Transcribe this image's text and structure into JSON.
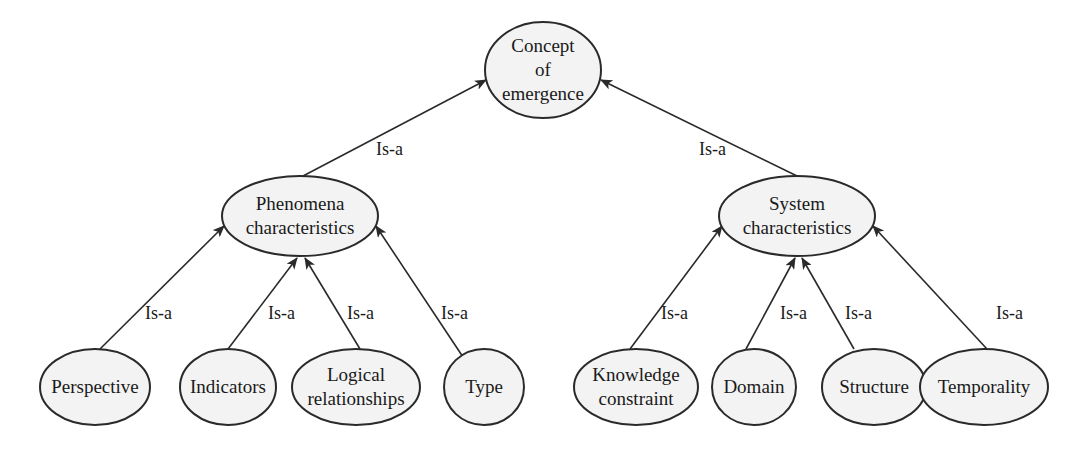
{
  "diagram": {
    "type": "hierarchy",
    "relation_label": "Is-a",
    "colors": {
      "node_fill": "#f3f3f3",
      "stroke": "#2a2a2a",
      "text": "#1a1a1a",
      "background": "#ffffff"
    },
    "nodes": [
      {
        "id": "root",
        "lines": [
          "Concept",
          "of",
          "emergence"
        ],
        "cx": 543,
        "cy": 70,
        "rx": 58,
        "ry": 48
      },
      {
        "id": "phenomena",
        "lines": [
          "Phenomena",
          "characteristics"
        ],
        "cx": 300,
        "cy": 216,
        "rx": 78,
        "ry": 40
      },
      {
        "id": "system",
        "lines": [
          "System",
          "characteristics"
        ],
        "cx": 797,
        "cy": 216,
        "rx": 78,
        "ry": 40
      },
      {
        "id": "perspective",
        "lines": [
          "Perspective"
        ],
        "cx": 95,
        "cy": 387,
        "rx": 55,
        "ry": 38
      },
      {
        "id": "indicators",
        "lines": [
          "Indicators"
        ],
        "cx": 228,
        "cy": 387,
        "rx": 48,
        "ry": 38
      },
      {
        "id": "logical",
        "lines": [
          "Logical",
          "relationships"
        ],
        "cx": 356,
        "cy": 387,
        "rx": 64,
        "ry": 38
      },
      {
        "id": "type",
        "lines": [
          "Type"
        ],
        "cx": 484,
        "cy": 387,
        "rx": 40,
        "ry": 38
      },
      {
        "id": "knowledge",
        "lines": [
          "Knowledge",
          "constraint"
        ],
        "cx": 636,
        "cy": 387,
        "rx": 62,
        "ry": 38
      },
      {
        "id": "domain",
        "lines": [
          "Domain"
        ],
        "cx": 754,
        "cy": 387,
        "rx": 42,
        "ry": 38
      },
      {
        "id": "structure",
        "lines": [
          "Structure"
        ],
        "cx": 874,
        "cy": 387,
        "rx": 52,
        "ry": 38
      },
      {
        "id": "temporality",
        "lines": [
          "Temporality"
        ],
        "cx": 984,
        "cy": 387,
        "rx": 64,
        "ry": 38
      }
    ],
    "edges": [
      {
        "from": "phenomena",
        "to": "root",
        "label": "Is-a",
        "x1": 303,
        "y1": 176,
        "x2": 486,
        "y2": 80,
        "lx": 376,
        "ly": 155
      },
      {
        "from": "system",
        "to": "root",
        "label": "Is-a",
        "x1": 797,
        "y1": 176,
        "x2": 601,
        "y2": 80,
        "lx": 699,
        "ly": 155
      },
      {
        "from": "perspective",
        "to": "phenomena",
        "label": "Is-a",
        "x1": 100,
        "y1": 349,
        "x2": 224,
        "y2": 226,
        "lx": 145,
        "ly": 319
      },
      {
        "from": "indicators",
        "to": "phenomena",
        "label": "Is-a",
        "x1": 228,
        "y1": 349,
        "x2": 297,
        "y2": 258,
        "lx": 268,
        "ly": 319
      },
      {
        "from": "logical",
        "to": "phenomena",
        "label": "Is-a",
        "x1": 360,
        "y1": 349,
        "x2": 305,
        "y2": 258,
        "lx": 347,
        "ly": 319
      },
      {
        "from": "type",
        "to": "phenomena",
        "label": "Is-a",
        "x1": 463,
        "y1": 357,
        "x2": 376,
        "y2": 226,
        "lx": 441,
        "ly": 319
      },
      {
        "from": "knowledge",
        "to": "system",
        "label": "Is-a",
        "x1": 630,
        "y1": 349,
        "x2": 722,
        "y2": 226,
        "lx": 661,
        "ly": 319
      },
      {
        "from": "domain",
        "to": "system",
        "label": "Is-a",
        "x1": 746,
        "y1": 349,
        "x2": 795,
        "y2": 258,
        "lx": 780,
        "ly": 319
      },
      {
        "from": "structure",
        "to": "system",
        "label": "Is-a",
        "x1": 854,
        "y1": 349,
        "x2": 802,
        "y2": 258,
        "lx": 845,
        "ly": 319
      },
      {
        "from": "temporality",
        "to": "system",
        "label": "Is-a",
        "x1": 987,
        "y1": 349,
        "x2": 873,
        "y2": 226,
        "lx": 996,
        "ly": 319
      }
    ]
  }
}
